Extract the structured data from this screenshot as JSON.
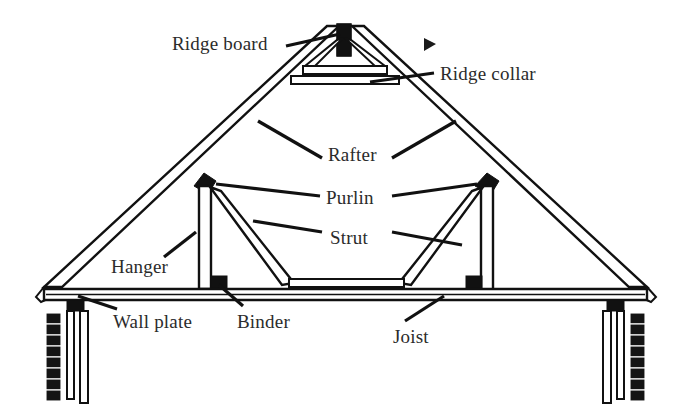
{
  "figure": {
    "background_color": "#ffffff",
    "ink_color": "#111111",
    "label_color": "#2b2b2b"
  },
  "labels": [
    {
      "id": "ridge-board",
      "text": "Ridge board",
      "x": 172,
      "y": 34,
      "anchor": "left"
    },
    {
      "id": "ridge-collar",
      "text": "Ridge collar",
      "x": 440,
      "y": 64,
      "anchor": "left"
    },
    {
      "id": "rafter",
      "text": "Rafter",
      "x": 328,
      "y": 145,
      "anchor": "left"
    },
    {
      "id": "purlin",
      "text": "Purlin",
      "x": 326,
      "y": 188,
      "anchor": "left"
    },
    {
      "id": "strut",
      "text": "Strut",
      "x": 330,
      "y": 228,
      "anchor": "left"
    },
    {
      "id": "hanger",
      "text": "Hanger",
      "x": 111,
      "y": 257,
      "anchor": "left"
    },
    {
      "id": "wall-plate",
      "text": "Wall plate",
      "x": 113,
      "y": 312,
      "anchor": "left"
    },
    {
      "id": "binder",
      "text": "Binder",
      "x": 237,
      "y": 312,
      "anchor": "left"
    },
    {
      "id": "joist",
      "text": "Joist",
      "x": 393,
      "y": 327,
      "anchor": "left"
    }
  ],
  "markers": [
    {
      "id": "cursor-arrow",
      "kind": "right-triangle",
      "x": 424,
      "y": 38,
      "width": 12,
      "height": 13
    }
  ],
  "components": [
    {
      "id": "ridge-board",
      "kind": "vertical-post",
      "note": "short solid black post at apex"
    },
    {
      "id": "ridge-collar",
      "kind": "horizontal-member",
      "note": "collar tie spanning rafters below apex"
    },
    {
      "id": "rafter-left",
      "kind": "sloping-member",
      "note": "left principal rafter"
    },
    {
      "id": "rafter-right",
      "kind": "sloping-member",
      "note": "right principal rafter"
    },
    {
      "id": "purlin-left",
      "kind": "joint-block",
      "note": "solid diamond purlin at left rafter"
    },
    {
      "id": "purlin-right",
      "kind": "joint-block",
      "note": "solid diamond purlin at right rafter"
    },
    {
      "id": "strut-left",
      "kind": "diagonal-brace",
      "note": "left strut from binder to purlin"
    },
    {
      "id": "strut-right",
      "kind": "diagonal-brace",
      "note": "right strut from binder to purlin"
    },
    {
      "id": "hanger-left",
      "kind": "vertical-post",
      "note": "left hanger post"
    },
    {
      "id": "hanger-right",
      "kind": "vertical-post",
      "note": "right hanger post"
    },
    {
      "id": "binder",
      "kind": "horizontal-member",
      "note": "binder beam between hanger feet"
    },
    {
      "id": "joist",
      "kind": "horizontal-member",
      "note": "ceiling joist spanning wall plates"
    },
    {
      "id": "wall-plate-left",
      "kind": "bearing-block",
      "note": "wall plate on left masonry wall"
    },
    {
      "id": "wall-plate-right",
      "kind": "bearing-block",
      "note": "wall plate on right masonry wall"
    },
    {
      "id": "wall-left",
      "kind": "masonry-wall",
      "note": "left brick-hatched wall"
    },
    {
      "id": "wall-right",
      "kind": "masonry-wall",
      "note": "right brick-hatched wall"
    }
  ]
}
